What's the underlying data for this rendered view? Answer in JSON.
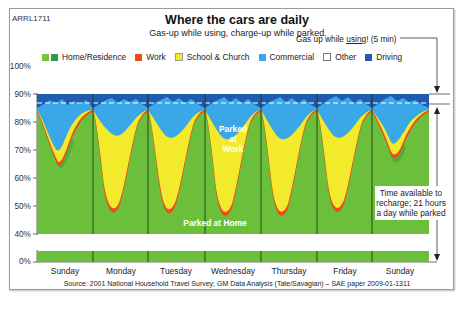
{
  "figure": {
    "code": "ARRL1711",
    "title": "Where the cars are daily",
    "subtitle": "Gas-up while using, charge-up while parked.",
    "source": "Source: 2001 National Household Travel Survey; GM Data Analysis (Tate/Savagian) – SAE paper 2009-01-1311"
  },
  "annotations": {
    "gas_up_prefix": "Gas up while ",
    "gas_up_underlined": "using",
    "gas_up_suffix": "! (5 min)",
    "recharge_line1": "Time available to",
    "recharge_line2": "recharge; 21 hours",
    "recharge_line3": "a day while parked",
    "parked_at_work_1": "Parked",
    "parked_at_work_2": "at",
    "parked_at_work_3": "Work",
    "parked_at_home": "Parked at Home"
  },
  "colors": {
    "home": "#6cbf3a",
    "home_dark": "#2f9a3c",
    "work": "#ee4a1c",
    "school": "#f2ea2a",
    "commercial": "#3aa8e6",
    "other": "#ffffff",
    "driving": "#1f5bb0"
  },
  "chart_data": {
    "type": "area",
    "title": "Where the cars are daily",
    "subtitle": "Gas-up while using, charge-up while parked.",
    "xlabel": "",
    "ylabel": "",
    "ylim": [
      0,
      100
    ],
    "y_axis_break": [
      5,
      38
    ],
    "yticks": [
      "0%",
      "40%",
      "50%",
      "60%",
      "70%",
      "80%",
      "90%",
      "100%"
    ],
    "categories": [
      "Sunday",
      "Monday",
      "Tuesday",
      "Wednesday",
      "Thursday",
      "Friday",
      "Sunday"
    ],
    "legend": [
      "Home/Residence",
      "Work",
      "School & Church",
      "Commercial",
      "Other",
      "Driving"
    ],
    "legend_position": "top",
    "stacked": true,
    "series_description": "Stacked share of cars by location over a week (hourly). Values are approximate daily minima/maxima read from the figure.",
    "series": [
      {
        "name": "Home/Residence",
        "min_by_day": [
          73,
          55,
          54,
          52,
          53,
          54,
          71
        ],
        "max_by_day": [
          97,
          97,
          97,
          97,
          97,
          97,
          97
        ]
      },
      {
        "name": "Work",
        "peak_share_by_day": [
          3,
          33,
          34,
          35,
          34,
          30,
          4
        ]
      },
      {
        "name": "School & Church",
        "peak_share_by_day": [
          6,
          2,
          2,
          2,
          2,
          2,
          1
        ]
      },
      {
        "name": "Commercial",
        "peak_share_by_day": [
          12,
          8,
          8,
          8,
          8,
          9,
          13
        ]
      },
      {
        "name": "Other",
        "peak_share_by_day": [
          1,
          1,
          1,
          1,
          1,
          1,
          1
        ]
      },
      {
        "name": "Driving",
        "peak_share_by_day": [
          5,
          6,
          6,
          6,
          6,
          7,
          6
        ]
      }
    ],
    "reference_lines": [
      {
        "y": 96,
        "style": "dashed-white",
        "label": "Gas up while using! (5 min)"
      }
    ],
    "annotations": [
      "Parked at Work",
      "Parked at Home",
      "Time available to recharge; 21 hours a day while parked"
    ],
    "grid": false
  }
}
